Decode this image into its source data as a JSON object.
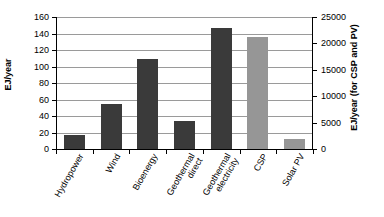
{
  "chart_data": {
    "type": "bar",
    "title": "",
    "xlabel": "",
    "ylabel": "EJ/year",
    "ylabel_right": "EJ/year (for CSP and PV)",
    "categories": [
      "Hydropower",
      "Wind",
      "Bioenergy",
      "Geothermal direct",
      "Geothermal electricity",
      "CSP",
      "Solar PV"
    ],
    "category_lines": [
      [
        "Hydropower"
      ],
      [
        "Wind"
      ],
      [
        "Bioenergy"
      ],
      [
        "Geothermal",
        "direct"
      ],
      [
        "Geothermal",
        "electricity"
      ],
      [
        "CSP"
      ],
      [
        "Solar PV"
      ]
    ],
    "values": [
      17,
      54,
      109,
      34,
      147,
      136,
      12
    ],
    "value_axis": [
      "left",
      "left",
      "left",
      "left",
      "left",
      "right",
      "right"
    ],
    "values_right_axis": [
      null,
      null,
      null,
      null,
      null,
      21300,
      1900
    ],
    "bar_colors": [
      "#3a3a3a",
      "#3a3a3a",
      "#3a3a3a",
      "#3a3a3a",
      "#3a3a3a",
      "#969696",
      "#969696"
    ],
    "ylim": [
      0,
      160
    ],
    "yticks": [
      0,
      20,
      40,
      60,
      80,
      100,
      120,
      140,
      160
    ],
    "ytick_labels": [
      "0",
      "20",
      "40",
      "60",
      "80",
      "100",
      "120",
      "140",
      "160"
    ],
    "ylim_right": [
      0,
      25000
    ],
    "yticks_right": [
      0,
      5000,
      10000,
      15000,
      20000,
      25000
    ],
    "ytick_labels_right": [
      "0",
      "5000",
      "10000",
      "15000",
      "20000",
      "25000"
    ],
    "grid": true,
    "grid_color": "#9a9a9a",
    "legend": null,
    "background": "#ffffff",
    "axis_color": "#000000",
    "dark_series_color": "#3a3a3a",
    "light_series_color": "#969696"
  }
}
